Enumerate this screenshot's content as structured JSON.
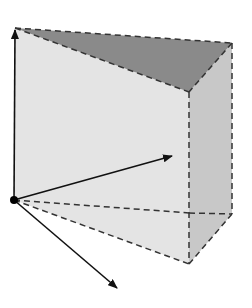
{
  "diagram": {
    "type": "3d-wedge-with-vectors",
    "colors": {
      "background": "#ffffff",
      "front_face": "#e4e4e4",
      "top_face": "#8a8a8a",
      "side_face": "#c8c8c8",
      "floor_face": "#ececec",
      "edge": "#222222",
      "dashed_edge": "#333333",
      "vector": "#111111",
      "origin_dot": "#000000"
    },
    "vertices": {
      "origin": [
        14,
        200
      ],
      "front_top_left": [
        15,
        28
      ],
      "front_top_right": [
        189,
        92
      ],
      "front_bottom_right": [
        189,
        264
      ],
      "back_top_right": [
        232,
        43
      ],
      "back_bottom_right": [
        232,
        214
      ],
      "hidden_mid": [
        189,
        213
      ]
    },
    "vectors": [
      {
        "name": "up-vector",
        "from": [
          14,
          200
        ],
        "to": [
          15,
          28
        ]
      },
      {
        "name": "right-vector",
        "from": [
          14,
          200
        ],
        "to": [
          172,
          156
        ]
      },
      {
        "name": "down-vector",
        "from": [
          14,
          200
        ],
        "to": [
          117,
          288
        ]
      }
    ],
    "labels": []
  }
}
